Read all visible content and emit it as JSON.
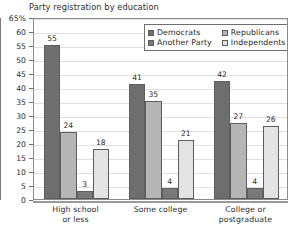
{
  "chart_data": {
    "type": "bar",
    "title": "Party registration by education",
    "xlabel": "",
    "ylabel": "",
    "ylim": [
      0,
      65
    ],
    "ytick_step": 5,
    "ytick_labels": [
      "65%",
      "60",
      "55",
      "50",
      "45",
      "40",
      "35",
      "30",
      "25",
      "20",
      "15",
      "10",
      "5",
      "0"
    ],
    "ytick_values": [
      65,
      60,
      55,
      50,
      45,
      40,
      35,
      30,
      25,
      20,
      15,
      10,
      5,
      0
    ],
    "grid": true,
    "legend_position": "upper-right-inside",
    "value_labels": true,
    "categories": [
      "High school or less",
      "Some college",
      "College or postgraduate"
    ],
    "category_lines": [
      [
        "High school",
        "or less"
      ],
      [
        "Some college"
      ],
      [
        "College or",
        "postgraduate"
      ]
    ],
    "series": [
      {
        "name": "Democrats",
        "color": "#6e6e6e",
        "values": [
          55,
          41,
          42
        ]
      },
      {
        "name": "Republicans",
        "color": "#b5b5b5",
        "values": [
          24,
          35,
          27
        ]
      },
      {
        "name": "Another Party",
        "color": "#7a7a7a",
        "values": [
          3,
          4,
          4
        ]
      },
      {
        "name": "Independents",
        "color": "#e3e3e3",
        "values": [
          18,
          21,
          26
        ]
      }
    ]
  }
}
